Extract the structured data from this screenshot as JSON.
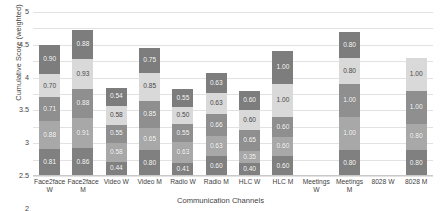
{
  "chart_data": {
    "type": "bar",
    "stacked": true,
    "title": "",
    "xlabel": "Communication Channels",
    "ylabel": "Cumulative Score (weighted)",
    "ylim": [
      0,
      5
    ],
    "yticks": [
      "0",
      "0.5",
      "1",
      "1.5",
      "2",
      "2.5",
      "3",
      "3.5",
      "4",
      "4.5",
      "5"
    ],
    "grid": true,
    "legend": "none",
    "categories": [
      "Face2face W",
      "Face2face M",
      "Video W",
      "Video M",
      "Radio W",
      "Radio M",
      "HLC W",
      "HLC M",
      "Meetings W",
      "Meetings M",
      "8028 W",
      "8028 M"
    ],
    "category_lines": [
      [
        "Face2face",
        "W"
      ],
      [
        "Face2face",
        "M"
      ],
      [
        "Video W",
        ""
      ],
      [
        "Video M",
        ""
      ],
      [
        "Radio W",
        ""
      ],
      [
        "Radio M",
        ""
      ],
      [
        "HLC W",
        ""
      ],
      [
        "HLC M",
        ""
      ],
      [
        "Meetings",
        "W"
      ],
      [
        "Meetings",
        "M"
      ],
      [
        "8028 W",
        ""
      ],
      [
        "8028 M",
        ""
      ]
    ],
    "series": [
      {
        "name": "Segment 1 (bottom)",
        "color": "#808080",
        "values": [
          0.81,
          0.86,
          0.44,
          0.8,
          0.41,
          0.6,
          0.4,
          0.6,
          0,
          0.8,
          0,
          0.8
        ]
      },
      {
        "name": "Segment 2",
        "color": "#a8a8a8",
        "values": [
          0.88,
          0.91,
          0.58,
          0.65,
          0.63,
          0.63,
          0.35,
          0.6,
          0,
          1.0,
          0,
          0.8
        ]
      },
      {
        "name": "Segment 3",
        "color": "#8f8f8f",
        "values": [
          0.71,
          0.88,
          0.55,
          0.85,
          0.55,
          0.66,
          0.65,
          0.6,
          0,
          1.0,
          0,
          1.0
        ]
      },
      {
        "name": "Segment 4",
        "color": "#d9d9d9",
        "values": [
          0.7,
          0.93,
          0.58,
          0.85,
          0.5,
          0.63,
          0.6,
          1.0,
          0,
          0.8,
          0,
          1.0
        ]
      },
      {
        "name": "Segment 5 (top)",
        "color": "#7d7d7d",
        "values": [
          0.9,
          0.88,
          0.54,
          0.75,
          0.55,
          0.63,
          0.6,
          1.0,
          0,
          0.8,
          0,
          0
        ]
      }
    ],
    "totals": [
      4.0,
      4.46,
      2.69,
      3.9,
      2.64,
      3.15,
      2.6,
      3.8,
      0,
      4.4,
      0,
      3.6
    ],
    "bar_labels": [
      [
        "0.81",
        "0.88",
        "0.71",
        "0.70",
        "0.90"
      ],
      [
        "0.86",
        "0.91",
        "0.88",
        "0.93",
        "0.88"
      ],
      [
        "0.44",
        "0.58",
        "0.55",
        "0.58",
        "0.54"
      ],
      [
        "0.80",
        "0.65",
        "0.85",
        "0.85",
        "0.75"
      ],
      [
        "0.41",
        "0.63",
        "0.55",
        "0.50",
        "0.55"
      ],
      [
        "0.60",
        "0.63",
        "0.66",
        "0.63",
        "0.63"
      ],
      [
        "0.40",
        "0.35",
        "0.65",
        "0.60",
        "0.60"
      ],
      [
        "0.60",
        "0.60",
        "0.60",
        "1.00",
        "1.00"
      ],
      [
        "",
        "",
        "",
        "",
        ""
      ],
      [
        "0.80",
        "1.00",
        "1.00",
        "0.80",
        "0.80"
      ],
      [
        "",
        "",
        "",
        "",
        ""
      ],
      [
        "0.80",
        "0.80",
        "1.00",
        "1.00",
        ""
      ]
    ]
  }
}
